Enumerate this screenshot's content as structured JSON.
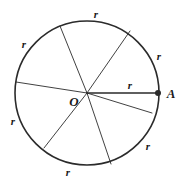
{
  "figure": {
    "type": "geometry-diagram",
    "background_color": "#ffffff",
    "stroke_color": "#2b2b2b",
    "label_color": "#1a1a1a",
    "circle": {
      "center_label": "O",
      "center_x": 87,
      "center_y": 93,
      "radius": 72,
      "stroke_width": 1.6
    },
    "center_point": {
      "label": "O",
      "label_x": 74,
      "label_y": 101
    },
    "marked_point": {
      "label": "A",
      "point_x": 158,
      "point_y": 93,
      "dot_radius": 3,
      "label_x": 171,
      "label_y": 93
    },
    "radii": [
      {
        "name": "radius-up-left",
        "x2": 60,
        "y2": 26,
        "stroke_width": 0.9
      },
      {
        "name": "radius-up-right",
        "x2": 130,
        "y2": 31,
        "stroke_width": 0.9
      },
      {
        "name": "radius-left",
        "x2": 16,
        "y2": 82,
        "stroke_width": 0.9
      },
      {
        "name": "radius-right-a",
        "x2": 158,
        "y2": 93,
        "stroke_width": 1.4
      },
      {
        "name": "radius-down-right",
        "x2": 152,
        "y2": 113,
        "stroke_width": 0.9
      },
      {
        "name": "radius-down-mid",
        "x2": 111,
        "y2": 164,
        "stroke_width": 0.9
      },
      {
        "name": "radius-down-left",
        "x2": 44,
        "y2": 148,
        "stroke_width": 0.9
      }
    ],
    "r_labels": [
      {
        "name": "r-label-top",
        "text": "r",
        "x": 96,
        "y": 14
      },
      {
        "name": "r-label-top-left",
        "text": "r",
        "x": 24,
        "y": 44
      },
      {
        "name": "r-label-top-right",
        "text": "r",
        "x": 159,
        "y": 56
      },
      {
        "name": "r-label-center-right",
        "text": "r",
        "x": 130,
        "y": 85
      },
      {
        "name": "r-label-left-lower",
        "text": "r",
        "x": 13,
        "y": 121
      },
      {
        "name": "r-label-bottom-right",
        "text": "r",
        "x": 148,
        "y": 146
      },
      {
        "name": "r-label-bottom",
        "text": "r",
        "x": 68,
        "y": 172
      }
    ]
  }
}
